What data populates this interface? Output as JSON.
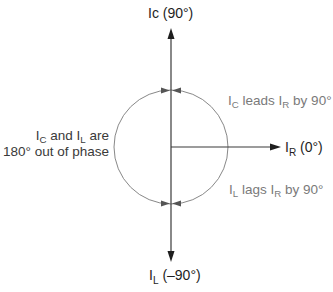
{
  "diagram": {
    "type": "phasor-diagram",
    "colors": {
      "axis": "#1e1e1e",
      "circle": "#888888",
      "annotation_text": "#7a7a7a",
      "label_text": "#1e1e1e"
    },
    "vectors": [
      {
        "id": "IC",
        "label_main": "Ic",
        "label_sub": "",
        "label_suffix": " (90°)",
        "angle_deg": 90
      },
      {
        "id": "IR",
        "label_main": "I",
        "label_sub": "R",
        "label_suffix": " (0°)",
        "angle_deg": 0
      },
      {
        "id": "IL",
        "label_main": "I",
        "label_sub": "L",
        "label_suffix": " (–90°)",
        "angle_deg": -90
      }
    ],
    "annotations": {
      "lead": {
        "p1": "I",
        "s1": "C",
        "p2": " leads I",
        "s2": "R",
        "p3": " by 90°"
      },
      "lag": {
        "p1": "I",
        "s1": "L",
        "p2": " lags I",
        "s2": "R",
        "p3": " by 90°"
      },
      "phase_line1": {
        "p1": "I",
        "s1": "C",
        "p2": " and I",
        "s2": "L",
        "p3": " are"
      },
      "phase_line2": "180° out of phase"
    }
  }
}
